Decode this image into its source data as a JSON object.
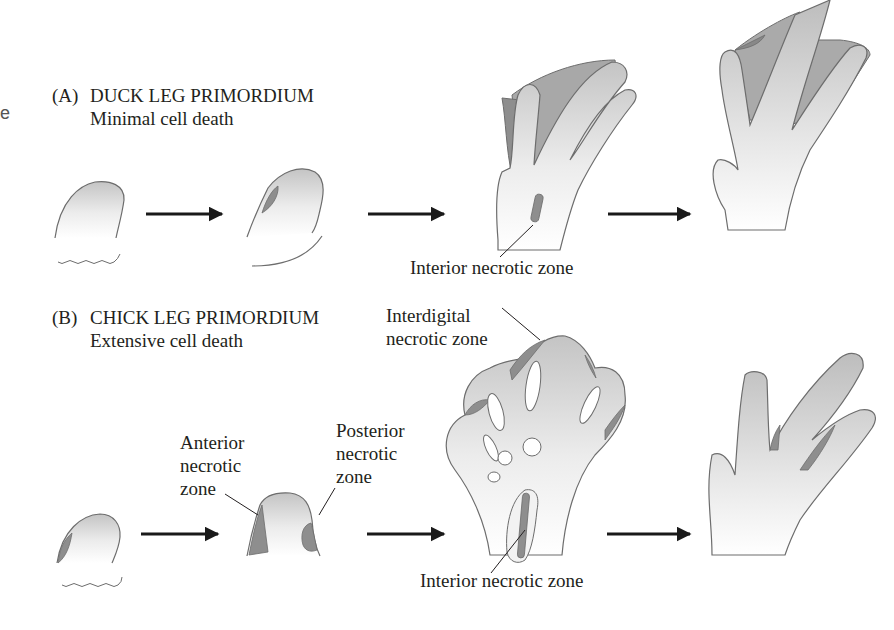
{
  "figure": {
    "stray_left_char": "e",
    "panel_a": {
      "label": "(A)",
      "title": "DUCK LEG PRIMORDIUM",
      "subtitle": "Minimal cell death",
      "annotations": {
        "interior": "Interior necrotic zone"
      }
    },
    "panel_b": {
      "label": "(B)",
      "title": "CHICK LEG PRIMORDIUM",
      "subtitle": "Extensive cell death",
      "annotations": {
        "anterior_1": "Anterior",
        "anterior_2": "necrotic",
        "anterior_3": "zone",
        "posterior_1": "Posterior",
        "posterior_2": "necrotic",
        "posterior_3": "zone",
        "interdigital_1": "Interdigital",
        "interdigital_2": "necrotic zone",
        "interior": "Interior necrotic zone"
      }
    },
    "colors": {
      "tissue_light": "#f4f4f4",
      "tissue_mid": "#c9c9c9",
      "necrotic": "#8e8e8e",
      "outline": "#6d6d6d",
      "arrow": "#1a1a1a"
    }
  }
}
